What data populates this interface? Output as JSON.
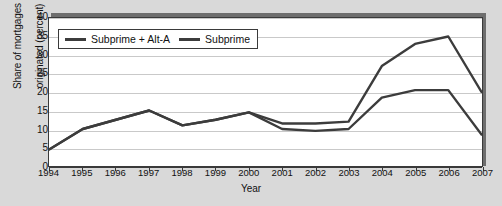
{
  "chart_data": {
    "type": "line",
    "title": "",
    "xlabel": "Year",
    "ylabel": "Share of mortgages originated (percent)",
    "ylabel_line1": "Share of mortgages",
    "ylabel_line2": "originated (percent)",
    "categories": [
      1994,
      1995,
      1996,
      1997,
      1998,
      1999,
      2000,
      2001,
      2002,
      2003,
      2004,
      2005,
      2006,
      2007
    ],
    "xtick_labels": [
      "1994",
      "1995",
      "1996",
      "1997",
      "1998",
      "1999",
      "2000",
      "2001",
      "2002",
      "2003",
      "2004",
      "2005",
      "2006",
      "2007"
    ],
    "ytick_labels": [
      "0",
      "5",
      "10",
      "15",
      "20",
      "25",
      "30",
      "35",
      "40"
    ],
    "ytick_values": [
      0,
      5,
      10,
      15,
      20,
      25,
      30,
      35,
      40
    ],
    "ylim": [
      0,
      40
    ],
    "xlim": [
      1994,
      2007
    ],
    "grid": true,
    "legend_position": "top-left",
    "series": [
      {
        "name": "Subprime + Alt-A",
        "color": "#3c3c3c",
        "values": [
          4.5,
          10.0,
          12.5,
          15.0,
          11.0,
          12.5,
          14.5,
          11.5,
          11.5,
          12.0,
          27.0,
          33.0,
          35.0,
          20.0
        ]
      },
      {
        "name": "Subprime",
        "color": "#3c3c3c",
        "values": [
          4.5,
          10.0,
          12.5,
          15.0,
          11.0,
          12.5,
          14.5,
          10.0,
          9.5,
          10.0,
          18.5,
          20.5,
          20.5,
          8.5
        ]
      }
    ]
  },
  "legend": {
    "items": [
      {
        "label": "Subprime + Alt-A"
      },
      {
        "label": "Subprime"
      }
    ]
  }
}
